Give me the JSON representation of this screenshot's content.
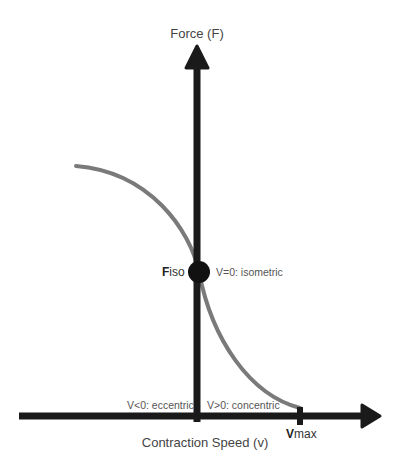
{
  "diagram": {
    "y_axis_label": "Force (F)",
    "x_axis_label": "Contraction Speed (v)",
    "point_label_prefix": "F",
    "point_label_suffix": "iso",
    "point_annotation": "V=0: isometric",
    "left_region_label": "V<0: eccentric",
    "right_region_label": "V>0: concentric",
    "vmax_prefix": "V",
    "vmax_suffix": "max",
    "colors": {
      "axis": "#1a1a1a",
      "curve": "#7a7a7a",
      "point": "#111111",
      "text": "#444444"
    }
  }
}
